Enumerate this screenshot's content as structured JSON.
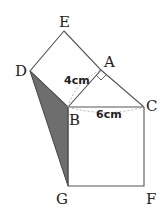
{
  "diagram": {
    "type": "geometry",
    "colors": {
      "stroke": "#555555",
      "shade": "#6e6e6e",
      "dash": "#a8a8a8",
      "text": "#222222"
    },
    "points": {
      "E": {
        "label": "E",
        "x": 64,
        "y": 31
      },
      "A": {
        "label": "A",
        "x": 101,
        "y": 70
      },
      "D": {
        "label": "D",
        "x": 30,
        "y": 71
      },
      "B": {
        "label": "B",
        "x": 68,
        "y": 107
      },
      "C": {
        "label": "C",
        "x": 144,
        "y": 107
      },
      "G": {
        "label": "G",
        "x": 68,
        "y": 186
      },
      "F": {
        "label": "F",
        "x": 144,
        "y": 186
      }
    },
    "measurements": {
      "AB": "4cm",
      "BC": "6cm"
    },
    "shaded_region": [
      "D",
      "B",
      "G"
    ],
    "right_angle_at": "A"
  }
}
